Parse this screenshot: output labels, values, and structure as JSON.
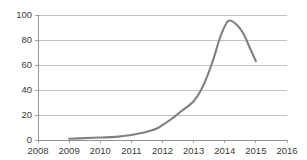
{
  "chart_data": {
    "type": "line",
    "title": "",
    "subtitle": "",
    "xlabel": "",
    "ylabel": "",
    "xlim": [
      2008,
      2016
    ],
    "ylim": [
      0,
      100
    ],
    "grid": true,
    "grid_axis": "y",
    "legend": false,
    "legend_position": "none",
    "x_ticks": [
      "2008",
      "2009",
      "2010",
      "2011",
      "2012",
      "2013",
      "2014",
      "2015",
      "2016"
    ],
    "y_ticks": [
      "0",
      "20",
      "40",
      "60",
      "80",
      "100"
    ],
    "x_tick_values": [
      2008,
      2009,
      2010,
      2011,
      2012,
      2013,
      2014,
      2015,
      2016
    ],
    "y_tick_values": [
      0,
      20,
      40,
      60,
      80,
      100
    ],
    "series": [
      {
        "name": "series-1",
        "color": "#808080",
        "x": [
          2009.0,
          2009.5,
          2010.0,
          2010.5,
          2011.0,
          2011.4,
          2011.8,
          2012.0,
          2012.3,
          2012.6,
          2013.0,
          2013.3,
          2013.6,
          2013.85,
          2014.1,
          2014.35,
          2014.6,
          2014.8,
          2015.0
        ],
        "values": [
          1,
          1.5,
          2,
          2.5,
          4,
          6,
          9,
          12,
          17,
          23,
          31,
          43,
          62,
          82,
          95,
          93,
          85,
          74,
          63
        ]
      }
    ],
    "annotations": []
  },
  "axis_colors": {
    "gridline": "#a8a8a8",
    "axis": "#8c8c8c",
    "tick_text": "#3a3a3a",
    "background": "#ffffff"
  },
  "plot_geometry": {
    "left": 38,
    "right": 287,
    "top": 15,
    "bottom": 140
  }
}
